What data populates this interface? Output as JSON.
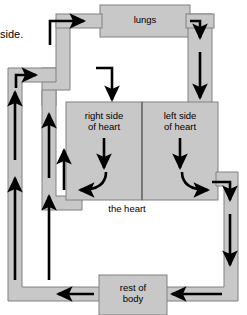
{
  "diagram": {
    "title_fragment": "side.",
    "colors": {
      "vessel_fill": "#c8c8c8",
      "vessel_stroke": "#808080",
      "arrow": "#000000",
      "text": "#000000",
      "background": "#ffffff"
    },
    "nodes": [
      {
        "id": "lungs",
        "label": "lungs",
        "x": 100,
        "y": 5,
        "w": 90,
        "h": 32
      },
      {
        "id": "right-heart",
        "label": "right side\nof heart",
        "x": 66,
        "y": 102,
        "w": 76,
        "h": 98
      },
      {
        "id": "left-heart",
        "label": "left side\nof heart",
        "x": 142,
        "y": 102,
        "w": 76,
        "h": 98
      },
      {
        "id": "heart-label",
        "label": "the heart",
        "x": 97,
        "y": 203,
        "w": 60,
        "h": 12
      },
      {
        "id": "rest-of-body",
        "label": "rest of\nbody",
        "x": 99,
        "y": 275,
        "w": 68,
        "h": 38
      }
    ],
    "flow_arrows": [
      {
        "id": "arrow-to-lungs",
        "from": "right-heart",
        "to": "lungs",
        "direction": "right"
      },
      {
        "id": "arrow-lungs-down",
        "from": "lungs",
        "to": "left-heart",
        "direction": "down"
      },
      {
        "id": "arrow-body-to-right",
        "from": "rest-of-body",
        "to": "right-heart",
        "direction": "up"
      },
      {
        "id": "arrow-right-heart-down",
        "from": "right-heart",
        "to": "pulmonary",
        "direction": "down"
      },
      {
        "id": "arrow-left-heart-down",
        "from": "left-heart",
        "to": "aorta",
        "direction": "down"
      },
      {
        "id": "arrow-left-to-body",
        "from": "left-heart",
        "to": "rest-of-body",
        "direction": "down"
      },
      {
        "id": "arrow-body-return-left",
        "from": "rest-of-body",
        "to": "vena-cava",
        "direction": "left"
      },
      {
        "id": "arrow-body-return-right",
        "from": "rest-of-body",
        "to": "vena-cava",
        "direction": "left"
      }
    ]
  }
}
